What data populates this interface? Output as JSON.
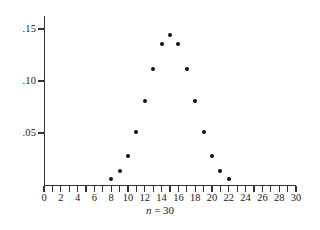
{
  "chart_data": {
    "type": "scatter",
    "title": "",
    "subtitle": "",
    "caption": "n = 30",
    "caption_variable": "n",
    "caption_equals": "=",
    "caption_value": "30",
    "xlabel": "",
    "ylabel": "",
    "xlim": [
      0,
      30
    ],
    "ylim": [
      0,
      0.1625
    ],
    "grid": false,
    "legend": null,
    "x_tick_step": 1,
    "x_labeled_step": 2,
    "x_tick_labels": [
      "0",
      "2",
      "4",
      "6",
      "8",
      "10",
      "12",
      "14",
      "16",
      "18",
      "20",
      "22",
      "24",
      "26",
      "28",
      "30"
    ],
    "x_tick_values": [
      0,
      2,
      4,
      6,
      8,
      10,
      12,
      14,
      16,
      18,
      20,
      22,
      24,
      26,
      28,
      30
    ],
    "y_tick_labels": [
      ".05",
      ".10",
      ".15"
    ],
    "y_tick_values": [
      0.05,
      0.1,
      0.15
    ],
    "x": [
      8,
      9,
      10,
      11,
      12,
      13,
      14,
      15,
      16,
      17,
      18,
      19,
      20,
      21,
      22
    ],
    "values": [
      0.0055,
      0.0133,
      0.028,
      0.0509,
      0.0806,
      0.1115,
      0.1354,
      0.1445,
      0.1354,
      0.1115,
      0.0806,
      0.0509,
      0.028,
      0.0133,
      0.0055
    ],
    "marker_color": "#111111",
    "axis_color": "#333333",
    "background_color": "#ffffff"
  }
}
